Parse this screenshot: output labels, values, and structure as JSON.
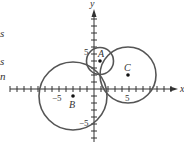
{
  "edge_fragments": [
    {
      "text": "s",
      "top": 27
    },
    {
      "text": "s",
      "top": 57
    },
    {
      "text": "n",
      "top": 70
    }
  ],
  "axes": {
    "x_label": "x",
    "y_label": "y",
    "origin_px": [
      94,
      89
    ],
    "unit_px": 7,
    "x_range": [
      -12,
      12
    ],
    "y_range": [
      -7,
      11
    ],
    "tick_labels": {
      "x_pos": "5",
      "x_neg": "−5",
      "y_pos": "5",
      "y_neg": "−5"
    }
  },
  "circles": [
    {
      "label": "A",
      "center": [
        1,
        4
      ],
      "radius": 2,
      "stroke": "#555555"
    },
    {
      "label": "B",
      "center": [
        -3,
        -1
      ],
      "radius": 5,
      "stroke": "#555555"
    },
    {
      "label": "C",
      "center": [
        5,
        2
      ],
      "radius": 4,
      "stroke": "#555555"
    }
  ],
  "colors": {
    "axis": "#333333",
    "circle": "#555555",
    "point": "#111111",
    "text": "#333333"
  }
}
